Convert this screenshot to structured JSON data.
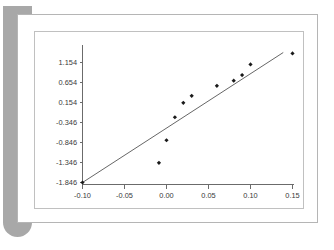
{
  "window": {
    "background_color": "#ffffff",
    "shadow_bar_color": "#a8a8a8",
    "card_border_color": "#b5b5b5",
    "frame_border_color": "#c0c0c0"
  },
  "chart_data": {
    "type": "scatter",
    "title": "",
    "subtitle": "",
    "xlabel": "",
    "ylabel": "",
    "xlim": [
      -0.1,
      0.155
    ],
    "ylim": [
      -1.846,
      1.404
    ],
    "grid": false,
    "legend": null,
    "xticks": [
      -0.1,
      -0.05,
      0.0,
      0.05,
      0.1,
      0.15
    ],
    "xticklabels": [
      "-0.10",
      "-0.05",
      "0.00",
      "0.05",
      "0.10",
      "0.15"
    ],
    "yticks": [
      1.154,
      0.654,
      0.154,
      -0.346,
      -0.846,
      -1.346,
      -1.846
    ],
    "yticklabels": [
      "1.154",
      "0.654",
      "0.154",
      "-0.346",
      "-0.846",
      "-1.346",
      "-1.846"
    ],
    "series": [
      {
        "name": "observations",
        "marker": "diamond",
        "color": "#1a1a1a",
        "points": [
          {
            "x": -0.1,
            "y": -1.846
          },
          {
            "x": -0.009,
            "y": -1.355
          },
          {
            "x": 0.0,
            "y": -0.79
          },
          {
            "x": 0.01,
            "y": -0.215
          },
          {
            "x": 0.02,
            "y": 0.145
          },
          {
            "x": 0.03,
            "y": 0.32
          },
          {
            "x": 0.06,
            "y": 0.57
          },
          {
            "x": 0.08,
            "y": 0.7
          },
          {
            "x": 0.09,
            "y": 0.84
          },
          {
            "x": 0.1,
            "y": 1.105
          },
          {
            "x": 0.15,
            "y": 1.38
          }
        ]
      }
    ],
    "trend_line": {
      "name": "reference-line",
      "color": "#555555",
      "x_start": -0.1,
      "y_start": -1.846,
      "x_end": 0.139,
      "y_end": 1.404
    }
  }
}
